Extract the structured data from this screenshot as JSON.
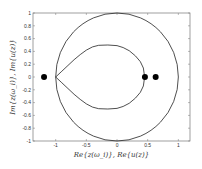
{
  "chart_data": {
    "type": "line",
    "title": "",
    "xlabel": "Re{z(ω_i)}, Re{u(z)}",
    "ylabel": "Im{z(ω_i)}, Im{u(z)}",
    "xlim": [
      -1.37,
      1.19
    ],
    "ylim": [
      -1,
      1
    ],
    "grid": false,
    "x_ticks": [
      -1,
      -0.5,
      0,
      0.5,
      1
    ],
    "x_tick_labels": [
      "-1",
      "-0.5",
      "0",
      "0.5",
      "1"
    ],
    "y_ticks": [
      -1,
      -0.8,
      -0.6,
      -0.4,
      -0.2,
      0,
      0.2,
      0.4,
      0.6,
      0.8,
      1
    ],
    "y_tick_labels": [
      "-1",
      "-0.8",
      "-0.6",
      "-0.4",
      "-0.2",
      "0",
      "0.2",
      "0.4",
      "0.6",
      "0.8",
      "1"
    ],
    "series": [
      {
        "name": "unit-circle",
        "kind": "circle",
        "center": [
          0,
          0
        ],
        "radius": 1,
        "color": "#222222"
      },
      {
        "name": "inner-teardrop-curve",
        "kind": "closed-curve",
        "color": "#222222",
        "upper_half": [
          [
            -1,
            0
          ],
          [
            -0.9,
            0.09
          ],
          [
            -0.8,
            0.18
          ],
          [
            -0.7,
            0.27
          ],
          [
            -0.6,
            0.35
          ],
          [
            -0.5,
            0.42
          ],
          [
            -0.4,
            0.47
          ],
          [
            -0.3,
            0.495
          ],
          [
            -0.15,
            0.5
          ],
          [
            0,
            0.49
          ],
          [
            0.1,
            0.46
          ],
          [
            0.2,
            0.41
          ],
          [
            0.3,
            0.33
          ],
          [
            0.38,
            0.24
          ],
          [
            0.43,
            0.14
          ],
          [
            0.45,
            0
          ]
        ]
      },
      {
        "name": "points",
        "kind": "scatter",
        "color": "#000000",
        "points": [
          [
            -1.19,
            0
          ],
          [
            0.455,
            0
          ],
          [
            0.63,
            0
          ]
        ]
      }
    ]
  }
}
